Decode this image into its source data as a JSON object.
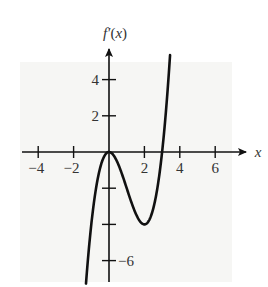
{
  "chart_data": {
    "type": "line",
    "title": "",
    "xlabel": "x",
    "ylabel": "f′(x)",
    "function": "f'(x) = x^2 (x - 3)",
    "x_ticks": [
      -4,
      -2,
      2,
      4,
      6
    ],
    "x_tick_labels": [
      "−4",
      "−2",
      "2",
      "4",
      "6"
    ],
    "y_ticks": [
      4,
      2,
      -2,
      -4,
      -6
    ],
    "y_tick_labels": [
      "4",
      "2",
      "",
      "",
      "−6"
    ],
    "xlim": [
      -5,
      7.5
    ],
    "ylim": [
      -7.5,
      5.8
    ],
    "grid": false,
    "legend": false,
    "series": [
      {
        "name": "f'(x)",
        "x": [
          -1.3,
          -1.2,
          -1.1,
          -1.0,
          -0.8,
          -0.6,
          -0.4,
          -0.2,
          0,
          0.25,
          0.5,
          0.75,
          1.0,
          1.25,
          1.5,
          1.75,
          2.0,
          2.25,
          2.5,
          2.75,
          3.0,
          3.2,
          3.4,
          3.45
        ],
        "y": [
          -7.3,
          -6.05,
          -4.96,
          -4.0,
          -2.43,
          -1.3,
          -0.54,
          -0.13,
          0,
          -0.17,
          -0.63,
          -1.27,
          -2.0,
          -2.73,
          -3.38,
          -3.83,
          -4.0,
          -3.8,
          -3.13,
          -1.89,
          0,
          1.28,
          3.01,
          3.52
        ]
      }
    ],
    "key_points": {
      "local_max": [
        0,
        0
      ],
      "local_min": [
        2,
        -4
      ],
      "zeros": [
        0,
        3
      ]
    }
  },
  "labels": {
    "y_axis": "f′(x)",
    "x_axis": "x"
  }
}
